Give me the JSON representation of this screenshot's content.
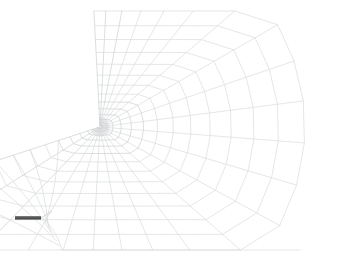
{
  "figure": {
    "title": "Crack-tip focused finite element mesh",
    "kind": "mesh-diagram",
    "width": 338,
    "height": 258,
    "background_color": "#ffffff"
  },
  "canvas": {
    "name": "fe-mesh-canvas",
    "description": "Quarter-domain polar spider-web mesh radiating from a crack tip"
  },
  "mesh": {
    "line_color": "#d9dbdc",
    "line_color_dense": "#cdd0d1",
    "line_width": 0.7,
    "focus_point": {
      "x": 100,
      "y": 127,
      "label": "crack-tip-focus"
    },
    "radial_count": 22,
    "ring_count": 14,
    "dense_inner_rings": 6,
    "outer_boundary": {
      "top_left": {
        "x": 98,
        "y": 11
      },
      "right_max_x": 305,
      "right_max_x_at_y": 162,
      "bottom_y": 250,
      "bottom_left_x": 62,
      "bottom_right_x": 300
    },
    "notch_tip": {
      "x": 43,
      "y": 218
    },
    "upper_sector": {
      "start_angle_deg": 268,
      "end_angle_deg": 360,
      "outer_radius": 205
    },
    "lower_sector": {
      "start_angle_deg": 0,
      "end_angle_deg": 62,
      "outer_radius": 205
    }
  },
  "crack": {
    "name": "crack-notch-bar",
    "color": "#6b6b6b",
    "highlight_color": "#4a4a4a",
    "x_start": 15,
    "x_end": 41,
    "y": 218,
    "thickness": 3.2,
    "leader": {
      "from": {
        "x": 41,
        "y": 218
      },
      "to": {
        "x": 52,
        "y": 211
      },
      "color": "#c9cccd"
    }
  },
  "legend": {
    "visible": false,
    "entries": []
  },
  "annotations": {
    "visible": false,
    "items": []
  }
}
